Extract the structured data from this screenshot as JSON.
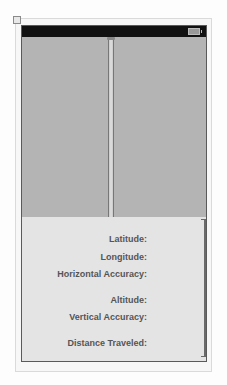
{
  "status_bar": {
    "battery_icon": "battery-icon"
  },
  "map_view": {
    "splitter_icon": "vertical-splitter-handle"
  },
  "info_panel": {
    "labels": [
      "Latitude:",
      "Longitude:",
      "Horizontal Accuracy:",
      "Altitude:",
      "Vertical Accuracy:",
      "Distance Traveled:"
    ]
  },
  "colors": {
    "status_bar": "#111111",
    "map_view": "#b4b4b4",
    "info_panel": "#e4e4e4",
    "label_text": "#555555"
  }
}
